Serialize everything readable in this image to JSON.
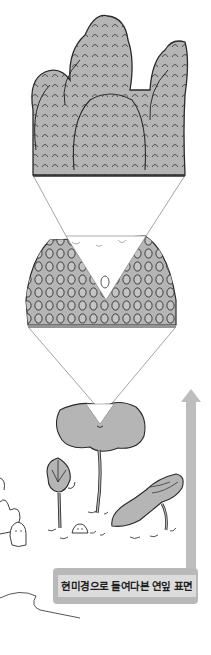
{
  "figure": {
    "caption": "현미경으로 들여다본 연잎 표면",
    "panels": [
      {
        "name": "microscopic-surface-bumps",
        "description": "magnified papillae of lotus leaf surface"
      },
      {
        "name": "leaf-surface-block",
        "description": "cross-section block of leaf surface covered in bumps"
      },
      {
        "name": "lotus-scene",
        "description": "lotus leaf, bud, curled leaf and water creatures"
      }
    ],
    "colors": {
      "fill_gray": "#b5b5b5",
      "ink": "#2a2a2a",
      "arrow_gray": "#bdbdbd",
      "label_bg": "#dcdcdc"
    }
  }
}
